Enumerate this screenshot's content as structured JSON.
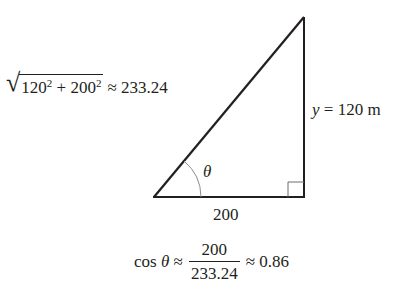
{
  "diagram": {
    "hypotenuse_label": {
      "radicand_a": "120",
      "radicand_b": "200",
      "exponent": "2",
      "plus": "+",
      "approx": "≈",
      "value": "233.24"
    },
    "vertical_side_label": {
      "variable": "y",
      "equals": "=",
      "value": "120 m"
    },
    "horizontal_side_label": "200",
    "angle_label": "θ",
    "formula": {
      "func": "cos",
      "angle": "θ",
      "approx1": "≈",
      "numerator": "200",
      "denominator": "233.24",
      "approx2": "≈",
      "result": "0.86"
    },
    "colors": {
      "stroke": "#231f20",
      "arc": "#8c8c8c",
      "right_angle_marker": "#6d6d6d"
    }
  }
}
